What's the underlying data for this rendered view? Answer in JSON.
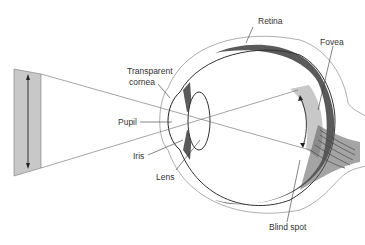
{
  "diagram": {
    "labels": {
      "retina": "Retina",
      "fovea": "Fovea",
      "cornea_line1": "Transparent",
      "cornea_line2": "cornea",
      "pupil": "Pupil",
      "iris": "Iris",
      "lens": "Lens",
      "blind_spot": "Blind spot"
    },
    "colors": {
      "tissue": "#5a5a5a",
      "image_fill": "#c8c8c8",
      "outline": "#555555",
      "ray": "#666666"
    }
  }
}
